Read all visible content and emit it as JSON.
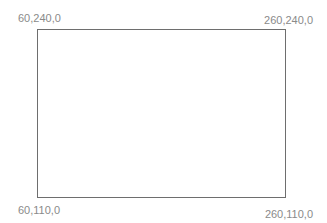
{
  "diagram": {
    "shape": "rectangle",
    "stroke_color": "#6e6e6e",
    "label_color": "#8a8a8a",
    "corners": {
      "top_left": "60,240,0",
      "top_right": "260,240,0",
      "bottom_left": "60,110,0",
      "bottom_right": "260,110,0"
    }
  }
}
